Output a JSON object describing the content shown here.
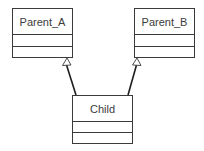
{
  "diagram": {
    "type": "uml-class-diagram",
    "classes": [
      {
        "id": "parent_a",
        "name": "Parent_A"
      },
      {
        "id": "parent_b",
        "name": "Parent_B"
      },
      {
        "id": "child",
        "name": "Child"
      }
    ],
    "relationships": [
      {
        "type": "generalization",
        "from": "Child",
        "to": "Parent_A"
      },
      {
        "type": "generalization",
        "from": "Child",
        "to": "Parent_B"
      }
    ]
  },
  "colors": {
    "line": "#3a3a3a",
    "text": "#3c3c3c",
    "background": "#ffffff"
  }
}
